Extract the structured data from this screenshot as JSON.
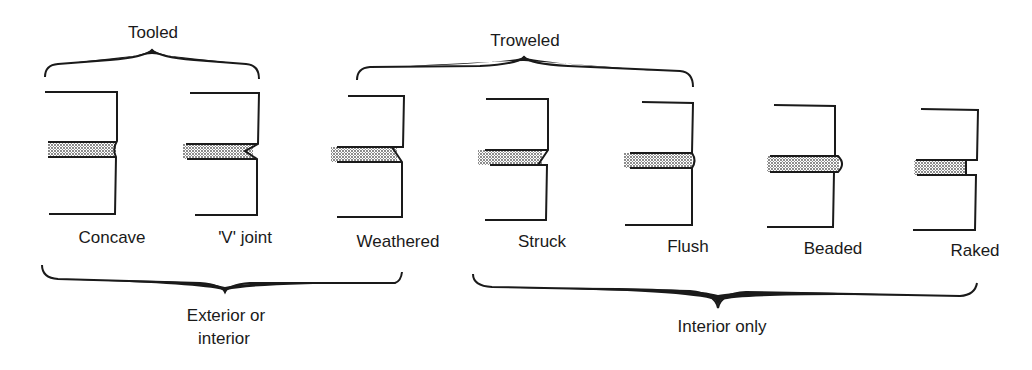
{
  "group_labels": {
    "tooled": "Tooled",
    "troweled": "Troweled",
    "exterior_or_interior_line1": "Exterior or",
    "exterior_or_interior_line2": "interior",
    "interior_only": "Interior only"
  },
  "joints": [
    {
      "label": "Concave"
    },
    {
      "label": "'V' joint"
    },
    {
      "label": "Weathered"
    },
    {
      "label": "Struck"
    },
    {
      "label": "Flush"
    },
    {
      "label": "Beaded"
    },
    {
      "label": "Raked"
    }
  ],
  "colors": {
    "ink": "#1a1a1a",
    "mortar_dots": "#555555",
    "background": "#ffffff"
  }
}
